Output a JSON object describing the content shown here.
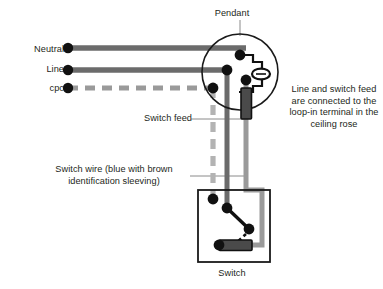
{
  "diagram": {
    "labels": {
      "neutral": "Neutral",
      "line": "Line",
      "cpc": "cpc",
      "pendant": "Pendant",
      "switch": "Switch",
      "switch_feed": "Switch feed",
      "loop_in_note": "Line and switch feed are connected to the loop-in terminal in the ceiling rose",
      "switch_wire_note": "Switch wire (blue with brown identification sleeving)"
    },
    "colors": {
      "text": "#231f20",
      "wire": "#6b6b6b",
      "wire_light": "#9a9a9a",
      "cpc_dash": "#9a9a9a",
      "outline": "#1a1a1a",
      "terminal": "#111111",
      "sleeve_fill": "#4a4a4a",
      "background": "#ffffff"
    },
    "components": [
      {
        "name": "pendant-rose",
        "type": "circle",
        "label": "Pendant"
      },
      {
        "name": "lamp-holder",
        "type": "lampholder"
      },
      {
        "name": "switch-box",
        "type": "rect",
        "label": "Switch"
      },
      {
        "name": "switch-lever",
        "type": "lever"
      },
      {
        "name": "sleeve-marker-rose",
        "type": "sleeve"
      },
      {
        "name": "sleeve-marker-switch",
        "type": "sleeve"
      }
    ],
    "wires": [
      {
        "name": "neutral-wire",
        "style": "solid",
        "color": "#6b6b6b",
        "label": "Neutral"
      },
      {
        "name": "line-wire",
        "style": "solid",
        "color": "#6b6b6b",
        "label": "Line"
      },
      {
        "name": "cpc-wire",
        "style": "dashed",
        "color": "#9a9a9a",
        "label": "cpc"
      },
      {
        "name": "switch-feed-wire",
        "style": "solid",
        "color": "#6b6b6b",
        "label": "Switch feed"
      },
      {
        "name": "switch-return-wire",
        "style": "solid",
        "color": "#9a9a9a",
        "label": "Switch wire"
      }
    ]
  }
}
